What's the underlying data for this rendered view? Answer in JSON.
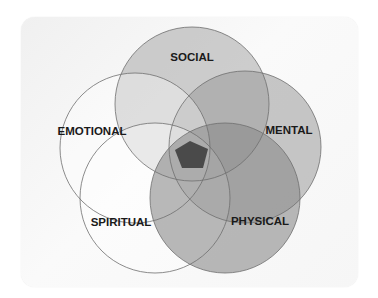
{
  "diagram": {
    "type": "venn",
    "sets": [
      {
        "id": "social",
        "label": "SOCIAL",
        "cx": 192,
        "cy": 104,
        "r": 77,
        "fill": "#a8a8a8",
        "opacity": 0.55
      },
      {
        "id": "mental",
        "label": "MENTAL",
        "cx": 245,
        "cy": 147,
        "r": 76,
        "fill": "#9a9a9a",
        "opacity": 0.55
      },
      {
        "id": "emotional",
        "label": "EMOTIONAL",
        "cx": 135,
        "cy": 148,
        "r": 75,
        "fill": "#ffffff",
        "opacity": 0.35
      },
      {
        "id": "spiritual",
        "label": "SPIRITUAL",
        "cx": 155,
        "cy": 198,
        "r": 75,
        "fill": "#ffffff",
        "opacity": 0.35
      },
      {
        "id": "physical",
        "label": "PHYSICAL",
        "cx": 225,
        "cy": 198,
        "r": 75,
        "fill": "#8a8a8a",
        "opacity": 0.6
      }
    ],
    "labels": [
      {
        "text": "SOCIAL",
        "x": 192,
        "y": 61
      },
      {
        "text": "MENTAL",
        "x": 289,
        "y": 134
      },
      {
        "text": "EMOTIONAL",
        "x": 92,
        "y": 135
      },
      {
        "text": "SPIRITUAL",
        "x": 121,
        "y": 226
      },
      {
        "text": "PHYSICAL",
        "x": 260,
        "y": 225
      }
    ],
    "center": {
      "label": "",
      "fill": "#4a4a4a",
      "points": "190,141 208,149 203,168 182,168 175,150"
    },
    "colors": {
      "stroke": "#6e6e6e",
      "card": "#f4f4f4"
    }
  }
}
